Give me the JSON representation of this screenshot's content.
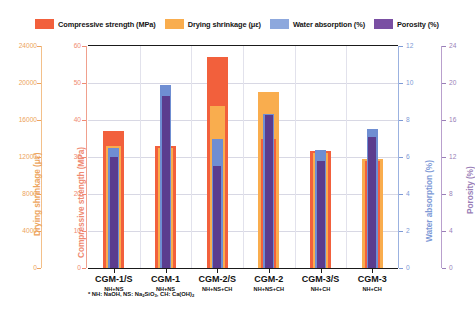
{
  "chart_data": {
    "type": "bar",
    "title": "",
    "xlabel": "",
    "categories": [
      "CGM-1/S",
      "CGM-1",
      "CGM-2/S",
      "CGM-2",
      "CGM-3/S",
      "CGM-3"
    ],
    "category_sublabels": [
      "NH+NS",
      "NH+NS",
      "NH+NS+CH",
      "NH+NS+CH",
      "NH+CH",
      "NH+CH"
    ],
    "footnote": "* NH: NaOH, NS: Na2SiO3, CH: Ca(OH)2",
    "footnote_parts": {
      "prefix": "* NH: NaOH, NS: Na",
      "sub1": "2",
      "mid1": "SiO",
      "sub2": "3",
      "mid2": ", CH: Ca(OH)",
      "sub3": "2"
    },
    "grid": true,
    "legend_position": "top",
    "series": [
      {
        "name": "Compressive strength (MPa)",
        "color": "#f2603c",
        "axis": "Compressive strength (MPa)",
        "ylim": [
          0,
          60
        ],
        "ticks": [
          0,
          10,
          20,
          30,
          40,
          50,
          60
        ],
        "values": [
          37.0,
          33.0,
          57.0,
          35.0,
          31.5,
          29.0
        ]
      },
      {
        "name": "Drying shrinkage (με)",
        "color": "#f9ad4e",
        "axis": "Drying shrinkage (με)",
        "ylim": [
          0,
          24000
        ],
        "ticks": [
          0,
          4000,
          8000,
          12000,
          16000,
          20000,
          24000
        ],
        "values": [
          13200,
          13000,
          17500,
          19000,
          12400,
          11800
        ]
      },
      {
        "name": "Water absorption (%)",
        "color": "#6f8ed2",
        "axis": "Water absorption (%)",
        "ylim": [
          0,
          12
        ],
        "ticks": [
          0,
          2,
          4,
          6,
          8,
          10,
          12
        ],
        "values": [
          6.5,
          9.9,
          7.0,
          8.3,
          6.4,
          7.5
        ]
      },
      {
        "name": "Porosity (%)",
        "color": "#5b3c8e",
        "axis": "Porosity (%)",
        "ylim": [
          0,
          24
        ],
        "ticks": [
          0,
          4,
          8,
          12,
          16,
          20,
          24
        ],
        "values": [
          12.0,
          18.6,
          11.0,
          16.5,
          11.6,
          14.2
        ]
      }
    ],
    "axes": [
      {
        "label": "Drying shrinkage (με)",
        "color": "#f2a65a",
        "ticks": [
          "0",
          "4000",
          "8000",
          "12000",
          "16000",
          "20000",
          "24000"
        ]
      },
      {
        "label": "Compressive strength (MPa)",
        "color": "#ef8a72",
        "ticks": [
          "0",
          "10",
          "20",
          "30",
          "40",
          "50",
          "60"
        ]
      },
      {
        "label": "Water absorption (%)",
        "color": "#7e9ad6",
        "ticks": [
          "0",
          "2",
          "4",
          "6",
          "8",
          "10",
          "12"
        ]
      },
      {
        "label": "Porosity (%)",
        "color": "#9a7fb8",
        "ticks": [
          "0",
          "4",
          "8",
          "12",
          "16",
          "20",
          "24"
        ]
      }
    ]
  }
}
